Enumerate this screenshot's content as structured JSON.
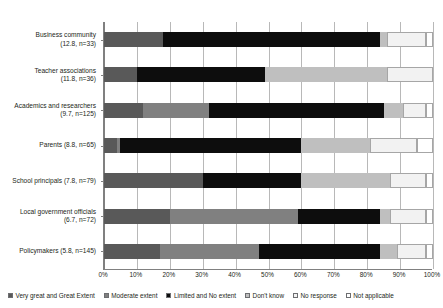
{
  "chart_data": {
    "type": "bar",
    "orientation": "horizontal",
    "stacked": true,
    "title": "",
    "xlabel": "",
    "ylabel": "",
    "xlim": [
      0,
      100
    ],
    "xtick_labels": [
      "0%",
      "10%",
      "20%",
      "30%",
      "40%",
      "50%",
      "60%",
      "70%",
      "80%",
      "90%",
      "100%"
    ],
    "xticks": [
      0,
      10,
      20,
      30,
      40,
      50,
      60,
      70,
      80,
      90,
      100
    ],
    "grid": true,
    "legend_position": "bottom",
    "categories": [
      "Business community\n(12.8, n=33)",
      "Teacher associations\n(11.8, n=36)",
      "Academics and researchers\n(9.7, n=125)",
      "Parents (8.8, n=65)",
      "School principals (7.8, n=79)",
      "Local government officials\n(6.7, n=72)",
      "Policymakers (5.8, n=145)"
    ],
    "series": [
      {
        "name": "Very great and Great Extent",
        "color": "#595959",
        "values": [
          18,
          10,
          12,
          4,
          30,
          20,
          17
        ]
      },
      {
        "name": "Moderate extent",
        "color": "#808080",
        "values": [
          0,
          0,
          20,
          1,
          0,
          39,
          30
        ]
      },
      {
        "name": "Limited and No extent",
        "color": "#0d0d0d",
        "values": [
          66,
          39,
          53,
          55,
          30,
          25,
          37
        ]
      },
      {
        "name": "Don't know",
        "color": "#bfbfbf",
        "values": [
          2,
          37,
          6,
          21,
          27,
          3,
          5
        ]
      },
      {
        "name": "No response",
        "color": "#f2f2f2",
        "values": [
          12,
          14,
          7,
          14,
          11,
          11,
          9
        ]
      },
      {
        "name": "Not applicable",
        "color": "#ffffff",
        "values": [
          2,
          0,
          2,
          5,
          2,
          2,
          2
        ]
      }
    ]
  },
  "ylabels": [
    {
      "line1": "Business community",
      "line2": "(12.8, n=33)"
    },
    {
      "line1": "Teacher associations",
      "line2": "(11.8, n=36)"
    },
    {
      "line1": "Academics and researchers",
      "line2": "(9.7, n=125)"
    },
    {
      "line1": "Parents (8.8, n=65)",
      "line2": ""
    },
    {
      "line1": "School principals (7.8, n=79)",
      "line2": ""
    },
    {
      "line1": "Local government officials",
      "line2": "(6.7, n=72)"
    },
    {
      "line1": "Policymakers (5.8, n=145)",
      "line2": ""
    }
  ],
  "legend": [
    {
      "label": "Very great and Great Extent",
      "color": "#595959"
    },
    {
      "label": "Moderate extent",
      "color": "#808080"
    },
    {
      "label": "Limited and No extent",
      "color": "#0d0d0d"
    },
    {
      "label": "Don't know",
      "color": "#bfbfbf"
    },
    {
      "label": "No response",
      "color": "#f2f2f2"
    },
    {
      "label": "Not applicable",
      "color": "#ffffff"
    }
  ],
  "axis": {
    "title_faint": ""
  }
}
